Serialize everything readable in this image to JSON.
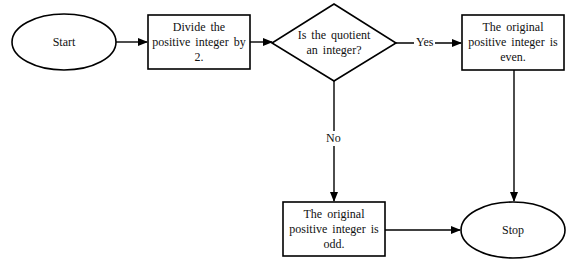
{
  "diagram": {
    "type": "flowchart",
    "nodes": {
      "start": {
        "shape": "ellipse",
        "text": "Start"
      },
      "divide": {
        "shape": "rectangle",
        "text": "Divide the positive integer by 2."
      },
      "decision": {
        "shape": "diamond",
        "text": "Is the quotient an integer?"
      },
      "even": {
        "shape": "rectangle",
        "text": "The original positive integer is even."
      },
      "odd": {
        "shape": "rectangle",
        "text": "The original positive integer is odd."
      },
      "stop": {
        "shape": "ellipse",
        "text": "Stop"
      }
    },
    "edges": {
      "yes": {
        "from": "decision",
        "to": "even",
        "label": "Yes"
      },
      "no": {
        "from": "decision",
        "to": "odd",
        "label": "No"
      }
    },
    "colors": {
      "stroke": "#000000",
      "background": "#ffffff",
      "text": "#111111"
    }
  }
}
